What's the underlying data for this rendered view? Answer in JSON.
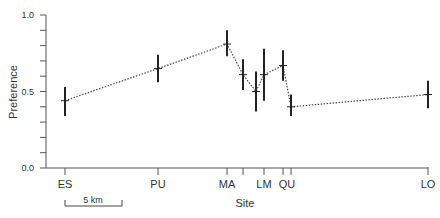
{
  "chart_data": {
    "type": "line",
    "title": "",
    "xlabel": "Site",
    "ylabel": "Preference",
    "ylim": [
      0.0,
      1.0
    ],
    "y_ticks": [
      0.0,
      0.1,
      0.2,
      0.3,
      0.4,
      0.5,
      0.6,
      0.7,
      0.8,
      0.9,
      1.0
    ],
    "y_tick_labels": [
      "0.0",
      "0.5",
      "1.0"
    ],
    "grid": false,
    "legend": null,
    "line_style": "dotted",
    "scale_bar": {
      "label": "5 km"
    },
    "points": [
      {
        "site": "ES",
        "label": "ES",
        "x_px": 65,
        "value": 0.44,
        "err_low": 0.34,
        "err_high": 0.53
      },
      {
        "site": "PU",
        "label": "PU",
        "x_px": 158,
        "value": 0.65,
        "err_low": 0.56,
        "err_high": 0.74
      },
      {
        "site": "MA",
        "label": "MA",
        "x_px": 227,
        "value": 0.81,
        "err_low": 0.73,
        "err_high": 0.9
      },
      {
        "site": "",
        "label": "",
        "x_px": 243,
        "value": 0.61,
        "err_low": 0.51,
        "err_high": 0.71
      },
      {
        "site": "",
        "label": "",
        "x_px": 256,
        "value": 0.5,
        "err_low": 0.37,
        "err_high": 0.63
      },
      {
        "site": "LM",
        "label": "LM",
        "x_px": 264,
        "value": 0.61,
        "err_low": 0.44,
        "err_high": 0.78
      },
      {
        "site": "",
        "label": "",
        "x_px": 283,
        "value": 0.67,
        "err_low": 0.57,
        "err_high": 0.77
      },
      {
        "site": "QU",
        "label": "QU",
        "x_px": 291,
        "value": 0.4,
        "err_low": 0.34,
        "err_high": 0.48
      },
      {
        "site": "LO",
        "label": "LO",
        "x_px": 428,
        "value": 0.48,
        "err_low": 0.39,
        "err_high": 0.57
      }
    ],
    "x_ticks_px": [
      65,
      158,
      227,
      243,
      264,
      283,
      291,
      428
    ],
    "x_tick_labels": [
      {
        "text": "ES",
        "x_px": 65
      },
      {
        "text": "PU",
        "x_px": 158
      },
      {
        "text": "MA",
        "x_px": 227
      },
      {
        "text": "LM",
        "x_px": 264
      },
      {
        "text": "QU",
        "x_px": 287
      },
      {
        "text": "LO",
        "x_px": 428
      }
    ]
  },
  "colors": {
    "line": "#444444",
    "axis": "#555555",
    "errorbar": "#222222"
  }
}
